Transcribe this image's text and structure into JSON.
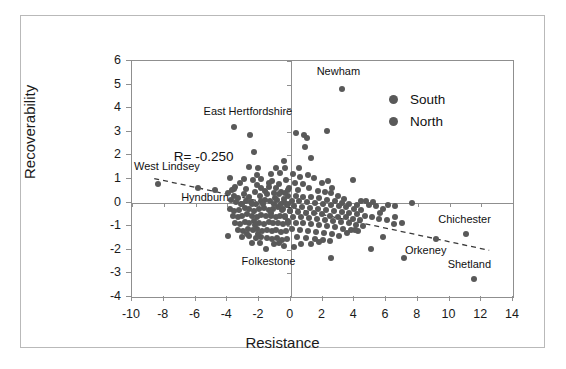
{
  "figure": {
    "background": "#ffffff",
    "frame_color": "#b9b9b9",
    "axis_color": "#8f8f8f",
    "point_color": "#595959",
    "text_color": "#111111"
  },
  "legend": {
    "position": "top-right-inside",
    "entries": [
      {
        "label": "South",
        "color": "#595959",
        "marker": "circle"
      },
      {
        "label": "North",
        "color": "#595959",
        "marker": "circle"
      }
    ]
  },
  "annotations": {
    "r_value": "R= -0.250",
    "points": [
      {
        "label": "Newham",
        "x": 3.2,
        "y": 4.8,
        "label_dx": -0.2,
        "label_dy": 0.75,
        "anchor": "center"
      },
      {
        "label": "East Hertfordshire",
        "x": -3.6,
        "y": 3.2,
        "label_dx": 0.9,
        "label_dy": 0.62,
        "anchor": "center"
      },
      {
        "label": "West Lindsey",
        "x": -8.35,
        "y": 0.78,
        "label_dx": 0.55,
        "label_dy": 0.72,
        "anchor": "center"
      },
      {
        "label": "Hyndburn",
        "x": -5.85,
        "y": 0.62,
        "label_dx": 0.45,
        "label_dy": -0.42,
        "anchor": "center"
      },
      {
        "label": "Folkestone",
        "x": -1.55,
        "y": -1.95,
        "label_dx": 0.15,
        "label_dy": -0.55,
        "anchor": "center"
      },
      {
        "label": "Chichester",
        "x": 11.05,
        "y": -1.35,
        "label_dx": -0.1,
        "label_dy": 0.62,
        "anchor": "center"
      },
      {
        "label": "Orkeney",
        "x": 9.15,
        "y": -1.55,
        "label_dx": -0.65,
        "label_dy": -0.52,
        "anchor": "center"
      },
      {
        "label": "Shetland",
        "x": 11.55,
        "y": -3.25,
        "label_dx": -0.3,
        "label_dy": 0.62,
        "anchor": "center"
      }
    ]
  },
  "chart_data": {
    "type": "scatter",
    "title": "",
    "xlabel": "Resistance",
    "ylabel": "Recoverability",
    "xlim": [
      -10,
      14
    ],
    "ylim": [
      -4,
      6
    ],
    "xticks": [
      -10,
      -8,
      -6,
      -4,
      -2,
      0,
      2,
      4,
      6,
      8,
      10,
      12,
      14
    ],
    "yticks": [
      -4,
      -3,
      -2,
      -1,
      0,
      1,
      2,
      3,
      4,
      5,
      6
    ],
    "xtick_labels": [
      "-10",
      "-8",
      "-6",
      "-4",
      "-2",
      "0",
      "2",
      "4",
      "6",
      "8",
      "10",
      "12",
      "14"
    ],
    "ytick_labels": [
      "-4",
      "-3",
      "-2",
      "-1",
      "0",
      "1",
      "2",
      "3",
      "4",
      "5",
      "6"
    ],
    "grid": false,
    "zero_lines": {
      "x": 0,
      "y": 0
    },
    "correlation": -0.25,
    "trendline": {
      "style": "dashed",
      "color": "#3a3a3a",
      "x0": -8.6,
      "y0": 1.02,
      "x1": 12.5,
      "y1": -2.02
    },
    "marker_size_px": 6,
    "series": [
      {
        "name": "South",
        "color": "#595959",
        "points": [
          [
            3.2,
            4.8
          ],
          [
            2.3,
            3.05
          ],
          [
            0.35,
            2.95
          ],
          [
            0.85,
            2.85
          ],
          [
            1.0,
            2.75
          ],
          [
            0.9,
            2.35
          ],
          [
            1.25,
            1.9
          ],
          [
            0.55,
            1.45
          ],
          [
            -0.45,
            1.75
          ],
          [
            -0.9,
            1.45
          ],
          [
            -0.35,
            1.45
          ],
          [
            -1.25,
            1.2
          ],
          [
            0.15,
            1.2
          ],
          [
            0.6,
            1.1
          ],
          [
            1.1,
            1.15
          ],
          [
            1.45,
            1.05
          ],
          [
            1.95,
            0.85
          ],
          [
            2.35,
            0.9
          ],
          [
            2.6,
            0.6
          ],
          [
            3.95,
            0.95
          ],
          [
            -0.3,
            0.95
          ],
          [
            0.25,
            0.85
          ],
          [
            0.75,
            0.8
          ],
          [
            -0.75,
            0.78
          ],
          [
            -1.4,
            0.85
          ],
          [
            -1.85,
            0.6
          ],
          [
            -2.15,
            0.75
          ],
          [
            -0.1,
            0.62
          ],
          [
            0.45,
            0.55
          ],
          [
            1.15,
            0.62
          ],
          [
            1.7,
            0.5
          ],
          [
            2.15,
            0.45
          ],
          [
            2.55,
            0.4
          ],
          [
            2.95,
            0.3
          ],
          [
            3.35,
            0.15
          ],
          [
            -0.6,
            0.45
          ],
          [
            -1.05,
            0.4
          ],
          [
            -1.5,
            0.35
          ],
          [
            -0.2,
            0.3
          ],
          [
            0.3,
            0.28
          ],
          [
            0.8,
            0.25
          ],
          [
            1.3,
            0.22
          ],
          [
            1.8,
            0.18
          ],
          [
            2.3,
            0.12
          ],
          [
            2.8,
            0.05
          ],
          [
            3.25,
            -0.02
          ],
          [
            3.7,
            -0.05
          ],
          [
            4.15,
            -0.12
          ],
          [
            -0.4,
            0.15
          ],
          [
            -0.85,
            0.12
          ],
          [
            0.05,
            0.08
          ],
          [
            0.55,
            0.05
          ],
          [
            1.05,
            0.02
          ],
          [
            1.55,
            -0.02
          ],
          [
            2.05,
            -0.05
          ],
          [
            2.55,
            -0.1
          ],
          [
            3.05,
            -0.15
          ],
          [
            3.5,
            -0.2
          ],
          [
            4.0,
            -0.25
          ],
          [
            4.45,
            -0.3
          ],
          [
            4.9,
            -0.1
          ],
          [
            5.35,
            -0.15
          ],
          [
            5.8,
            -0.25
          ],
          [
            6.15,
            -0.1
          ],
          [
            6.55,
            -0.6
          ],
          [
            7.0,
            -0.85
          ],
          [
            7.65,
            -0.02
          ],
          [
            -0.25,
            -0.12
          ],
          [
            0.2,
            -0.15
          ],
          [
            0.7,
            -0.18
          ],
          [
            1.2,
            -0.22
          ],
          [
            1.7,
            -0.25
          ],
          [
            2.2,
            -0.3
          ],
          [
            2.7,
            -0.35
          ],
          [
            3.2,
            -0.4
          ],
          [
            3.7,
            -0.45
          ],
          [
            4.2,
            -0.5
          ],
          [
            4.65,
            -0.55
          ],
          [
            -0.55,
            -0.3
          ],
          [
            -0.05,
            -0.35
          ],
          [
            0.45,
            -0.38
          ],
          [
            0.95,
            -0.42
          ],
          [
            1.45,
            -0.45
          ],
          [
            1.95,
            -0.5
          ],
          [
            2.45,
            -0.55
          ],
          [
            2.95,
            -0.6
          ],
          [
            3.45,
            -0.62
          ],
          [
            3.9,
            -0.68
          ],
          [
            4.35,
            -0.72
          ],
          [
            5.1,
            -0.6
          ],
          [
            5.55,
            -0.7
          ],
          [
            6.05,
            -0.75
          ],
          [
            6.5,
            -0.9
          ],
          [
            -0.35,
            -0.55
          ],
          [
            0.15,
            -0.6
          ],
          [
            0.65,
            -0.62
          ],
          [
            1.15,
            -0.65
          ],
          [
            1.65,
            -0.7
          ],
          [
            2.15,
            -0.72
          ],
          [
            2.65,
            -0.78
          ],
          [
            3.15,
            -0.82
          ],
          [
            3.65,
            -0.88
          ],
          [
            4.1,
            -0.95
          ],
          [
            4.55,
            -1.0
          ],
          [
            -0.2,
            -0.8
          ],
          [
            0.3,
            -0.85
          ],
          [
            0.8,
            -0.88
          ],
          [
            1.3,
            -0.92
          ],
          [
            1.8,
            -0.95
          ],
          [
            2.3,
            -1.0
          ],
          [
            2.8,
            -1.05
          ],
          [
            3.3,
            -1.1
          ],
          [
            3.8,
            -1.15
          ],
          [
            4.25,
            -1.2
          ],
          [
            4.05,
            -1.15
          ],
          [
            0.1,
            -1.1
          ],
          [
            0.6,
            -1.15
          ],
          [
            1.1,
            -1.2
          ],
          [
            1.6,
            -1.25
          ],
          [
            2.1,
            -1.3
          ],
          [
            2.6,
            -1.35
          ],
          [
            3.05,
            -1.4
          ],
          [
            3.55,
            -1.3
          ],
          [
            0.4,
            -1.45
          ],
          [
            0.95,
            -1.5
          ],
          [
            1.5,
            -1.55
          ],
          [
            2.0,
            -1.6
          ],
          [
            2.5,
            -1.62
          ],
          [
            1.25,
            -1.75
          ],
          [
            1.75,
            -1.65
          ],
          [
            0.65,
            -1.75
          ],
          [
            0.2,
            -1.88
          ],
          [
            5.05,
            -1.95
          ],
          [
            5.8,
            -1.45
          ],
          [
            7.15,
            -2.35
          ],
          [
            9.15,
            -1.55
          ],
          [
            11.05,
            -1.35
          ],
          [
            11.55,
            -3.25
          ],
          [
            2.55,
            -2.35
          ],
          [
            6.55,
            -0.15
          ],
          [
            5.2,
            0.02
          ],
          [
            5.65,
            -0.42
          ],
          [
            4.75,
            0.05
          ],
          [
            4.45,
            0.05
          ]
        ]
      },
      {
        "name": "North",
        "color": "#595959",
        "points": [
          [
            -8.35,
            0.78
          ],
          [
            -5.85,
            0.62
          ],
          [
            -4.75,
            0.55
          ],
          [
            -3.6,
            3.2
          ],
          [
            -2.55,
            2.85
          ],
          [
            -2.3,
            2.15
          ],
          [
            -2.6,
            1.5
          ],
          [
            -2.05,
            1.45
          ],
          [
            -3.85,
            1.05
          ],
          [
            -3.5,
            0.68
          ],
          [
            -3.2,
            0.85
          ],
          [
            -2.85,
            0.58
          ],
          [
            -3.95,
            0.4
          ],
          [
            -3.6,
            0.3
          ],
          [
            -3.3,
            0.2
          ],
          [
            -2.95,
            0.35
          ],
          [
            -2.6,
            0.25
          ],
          [
            -2.25,
            0.45
          ],
          [
            -1.95,
            0.3
          ],
          [
            -1.65,
            0.5
          ],
          [
            -3.75,
            0.1
          ],
          [
            -3.45,
            0.02
          ],
          [
            -3.15,
            -0.05
          ],
          [
            -2.8,
            0.08
          ],
          [
            -2.5,
            0.02
          ],
          [
            -2.2,
            -0.05
          ],
          [
            -1.9,
            0.08
          ],
          [
            -1.6,
            0.12
          ],
          [
            -1.3,
            0.05
          ],
          [
            -1.0,
            0.18
          ],
          [
            -3.85,
            -0.25
          ],
          [
            -3.55,
            -0.35
          ],
          [
            -3.25,
            -0.3
          ],
          [
            -2.9,
            -0.22
          ],
          [
            -2.6,
            -0.28
          ],
          [
            -2.3,
            -0.35
          ],
          [
            -2.0,
            -0.28
          ],
          [
            -1.7,
            -0.22
          ],
          [
            -1.4,
            -0.3
          ],
          [
            -1.1,
            -0.25
          ],
          [
            -0.8,
            -0.2
          ],
          [
            -0.5,
            -0.25
          ],
          [
            -3.65,
            -0.55
          ],
          [
            -3.35,
            -0.62
          ],
          [
            -3.05,
            -0.58
          ],
          [
            -2.75,
            -0.5
          ],
          [
            -2.45,
            -0.55
          ],
          [
            -2.15,
            -0.6
          ],
          [
            -1.85,
            -0.52
          ],
          [
            -1.55,
            -0.58
          ],
          [
            -1.25,
            -0.55
          ],
          [
            -0.95,
            -0.6
          ],
          [
            -0.65,
            -0.55
          ],
          [
            -0.35,
            -0.6
          ],
          [
            -3.5,
            -0.85
          ],
          [
            -3.2,
            -0.9
          ],
          [
            -2.9,
            -0.82
          ],
          [
            -2.6,
            -0.88
          ],
          [
            -2.3,
            -0.8
          ],
          [
            -2.0,
            -0.85
          ],
          [
            -1.7,
            -0.9
          ],
          [
            -1.4,
            -0.82
          ],
          [
            -1.1,
            -0.88
          ],
          [
            -0.8,
            -0.85
          ],
          [
            -0.5,
            -0.9
          ],
          [
            -0.2,
            -0.85
          ],
          [
            -3.3,
            -1.15
          ],
          [
            -3.0,
            -1.2
          ],
          [
            -2.7,
            -1.1
          ],
          [
            -2.4,
            -1.18
          ],
          [
            -2.1,
            -1.12
          ],
          [
            -1.8,
            -1.2
          ],
          [
            -1.5,
            -1.15
          ],
          [
            -1.2,
            -1.22
          ],
          [
            -0.9,
            -1.18
          ],
          [
            -0.6,
            -1.25
          ],
          [
            -0.3,
            -1.2
          ],
          [
            -3.95,
            -1.4
          ],
          [
            -3.1,
            -1.45
          ],
          [
            -2.6,
            -1.42
          ],
          [
            -2.2,
            -1.5
          ],
          [
            -1.85,
            -1.45
          ],
          [
            -1.5,
            -1.5
          ],
          [
            -1.15,
            -1.55
          ],
          [
            -0.85,
            -1.5
          ],
          [
            -0.55,
            -1.58
          ],
          [
            -0.25,
            -1.55
          ],
          [
            -1.55,
            -1.95
          ],
          [
            -0.45,
            -1.85
          ],
          [
            -2.45,
            -1.7
          ],
          [
            -1.95,
            -1.7
          ],
          [
            -1.05,
            -1.75
          ],
          [
            -0.75,
            -1.72
          ],
          [
            -2.95,
            1.02
          ],
          [
            -2.35,
            0.95
          ],
          [
            -1.85,
            1.02
          ],
          [
            -1.15,
            0.9
          ],
          [
            -0.65,
            1.25
          ],
          [
            -2.75,
            -1.35
          ],
          [
            -3.55,
            0.58
          ],
          [
            -2.15,
            1.18
          ],
          [
            -0.95,
            0.62
          ],
          [
            -1.35,
            0.68
          ],
          [
            -2.45,
            -0.08
          ],
          [
            -1.75,
            -0.05
          ],
          [
            -1.05,
            -0.08
          ],
          [
            -0.45,
            0.02
          ],
          [
            -0.15,
            -0.05
          ],
          [
            -0.75,
            0.35
          ],
          [
            -0.35,
            0.42
          ],
          [
            -2.05,
            -1.32
          ],
          [
            -0.15,
            0.55
          ],
          [
            -0.05,
            -0.35
          ],
          [
            -0.6,
            -0.05
          ],
          [
            -1.25,
            -0.45
          ],
          [
            -2.25,
            -0.95
          ],
          [
            -3.05,
            -0.08
          ],
          [
            -3.7,
            0.55
          ]
        ]
      }
    ]
  }
}
